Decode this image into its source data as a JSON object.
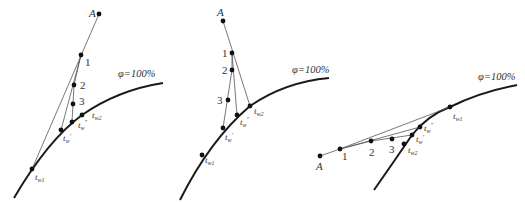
{
  "panels": [
    {
      "id": "left",
      "curve_label": "φ=100%",
      "point_a": "A",
      "points": [
        "1",
        "2",
        "3"
      ],
      "t_labels": {
        "tw1": "t",
        "tw1_sub": "w1",
        "tw_prime": "t",
        "tw_prime_sub": "w",
        "tw_prime_mark": "'",
        "tw_dprime": "t",
        "tw_dprime_sub": "w",
        "tw_dprime_mark": "\"",
        "tw2": "t",
        "tw2_sub": "w2"
      }
    },
    {
      "id": "middle",
      "curve_label": "φ=100%",
      "point_a": "A",
      "points": [
        "1",
        "2",
        "3"
      ],
      "t_labels": {
        "tw1": "t",
        "tw1_sub": "w1",
        "tw_prime": "t",
        "tw_prime_sub": "w",
        "tw_prime_mark": "'",
        "tw_dprime": "t",
        "tw_dprime_sub": "w",
        "tw_dprime_mark": "\"",
        "tw2": "t",
        "tw2_sub": "w2"
      }
    },
    {
      "id": "right",
      "curve_label": "φ=100%",
      "point_a": "A",
      "points": [
        "1",
        "2",
        "3"
      ],
      "t_labels": {
        "tw1": "t",
        "tw1_sub": "w1",
        "tw_prime": "t",
        "tw_prime_sub": "w",
        "tw_prime_mark": "'",
        "tw_dprime": "t",
        "tw_dprime_sub": "w",
        "tw_dprime_mark": "\"",
        "tw2": "t",
        "tw2_sub": "w2"
      }
    }
  ]
}
